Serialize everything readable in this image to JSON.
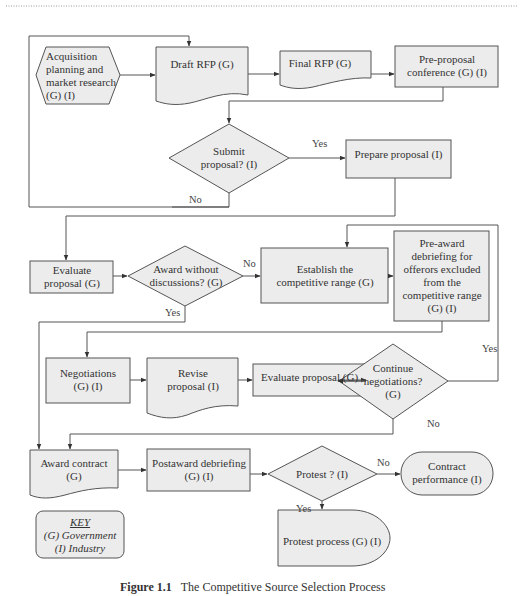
{
  "diagram": {
    "title": "The Competitive Source Selection Process",
    "caption_label": "Figure 1.1",
    "caption_text": "The Competitive Source Selection Process",
    "colors": {
      "fill": "#ececec",
      "stroke": "#555555",
      "background": "#ffffff"
    },
    "nodes": {
      "acquisition": {
        "type": "preparation-hexagon",
        "label": "Acquisition planning and market research (G) (I)"
      },
      "draft_rfp": {
        "type": "document",
        "label": "Draft RFP (G)"
      },
      "final_rfp": {
        "type": "document",
        "label": "Final RFP (G)"
      },
      "pre_proposal": {
        "type": "process",
        "label": "Pre-proposal conference (G) (I)"
      },
      "submit_proposal": {
        "type": "decision",
        "label": "Submit proposal? (I)"
      },
      "prepare_proposal": {
        "type": "process",
        "label": "Prepare proposal (I)"
      },
      "evaluate_proposal_1": {
        "type": "process",
        "label": "Evaluate proposal (G)"
      },
      "award_without_discussions": {
        "type": "decision",
        "label": "Award without discussions? (G)"
      },
      "establish_range": {
        "type": "process",
        "label": "Establish the competitive range (G)"
      },
      "pre_award_debriefing": {
        "type": "process",
        "label": "Pre-award debriefing for offerors excluded from the competitive range (G) (I)"
      },
      "negotiations": {
        "type": "process",
        "label": "Negotiations (G) (I)"
      },
      "revise_proposal": {
        "type": "document",
        "label": "Revise proposal (I)"
      },
      "evaluate_proposal_2": {
        "type": "process",
        "label": "Evaluate proposal (G)"
      },
      "continue_negotiations": {
        "type": "decision",
        "label": "Continue negotiations? (G)"
      },
      "award_contract": {
        "type": "document",
        "label": "Award contract (G)"
      },
      "postaward_debriefing": {
        "type": "process",
        "label": "Postaward debriefing (G) (I)"
      },
      "protest": {
        "type": "decision",
        "label": "Protest ? (I)"
      },
      "contract_performance": {
        "type": "terminator",
        "label": "Contract performance (I)"
      },
      "protest_process": {
        "type": "delay",
        "label": "Protest process (G) (I)"
      }
    },
    "edge_labels": {
      "submit_yes": "Yes",
      "submit_no": "No",
      "award_no": "No",
      "award_yes": "Yes",
      "continue_yes": "Yes",
      "continue_no": "No",
      "protest_no": "No",
      "protest_yes": "Yes"
    },
    "edges": [
      {
        "from": "acquisition",
        "to": "draft_rfp"
      },
      {
        "from": "draft_rfp",
        "to": "final_rfp"
      },
      {
        "from": "final_rfp",
        "to": "pre_proposal"
      },
      {
        "from": "pre_proposal",
        "to": "submit_proposal"
      },
      {
        "from": "submit_proposal",
        "to": "prepare_proposal",
        "label": "Yes"
      },
      {
        "from": "submit_proposal",
        "to": "draft_rfp",
        "label": "No"
      },
      {
        "from": "prepare_proposal",
        "to": "evaluate_proposal_1"
      },
      {
        "from": "evaluate_proposal_1",
        "to": "award_without_discussions"
      },
      {
        "from": "award_without_discussions",
        "to": "establish_range",
        "label": "No"
      },
      {
        "from": "award_without_discussions",
        "to": "award_contract",
        "label": "Yes"
      },
      {
        "from": "establish_range",
        "to": "pre_award_debriefing"
      },
      {
        "from": "pre_award_debriefing",
        "to": "negotiations"
      },
      {
        "from": "negotiations",
        "to": "revise_proposal"
      },
      {
        "from": "revise_proposal",
        "to": "evaluate_proposal_2"
      },
      {
        "from": "evaluate_proposal_2",
        "to": "continue_negotiations"
      },
      {
        "from": "continue_negotiations",
        "to": "establish_range",
        "label": "Yes"
      },
      {
        "from": "continue_negotiations",
        "to": "award_contract",
        "label": "No"
      },
      {
        "from": "award_contract",
        "to": "postaward_debriefing"
      },
      {
        "from": "postaward_debriefing",
        "to": "protest"
      },
      {
        "from": "protest",
        "to": "contract_performance",
        "label": "No"
      },
      {
        "from": "protest",
        "to": "protest_process",
        "label": "Yes"
      }
    ],
    "key": {
      "title": "KEY",
      "line1": "(G) Government",
      "line2": "(I) Industry"
    }
  }
}
